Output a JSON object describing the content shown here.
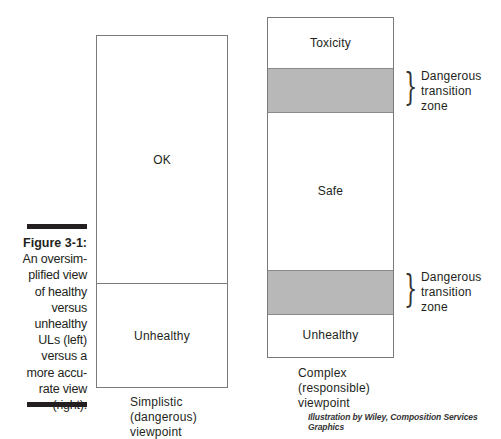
{
  "figure": {
    "number": "Figure 3-1:",
    "caption_lines": [
      "An oversim-",
      "plified view",
      "of healthy",
      "versus",
      "unhealthy",
      "ULs (left)",
      "versus a",
      "more accu-",
      "rate view",
      "(right)."
    ]
  },
  "left_diagram": {
    "zones": [
      {
        "label": "OK",
        "shaded": false
      },
      {
        "label": "Unhealthy",
        "shaded": false
      }
    ],
    "title_lines": [
      "Simplistic",
      "(dangerous)",
      "viewpoint"
    ]
  },
  "right_diagram": {
    "zones": [
      {
        "label": "Toxicity",
        "shaded": false
      },
      {
        "label": "",
        "shaded": true
      },
      {
        "label": "Safe",
        "shaded": false
      },
      {
        "label": "",
        "shaded": true
      },
      {
        "label": "Unhealthy",
        "shaded": false
      }
    ],
    "annotations": [
      {
        "lines": [
          "Dangerous",
          "transition",
          "zone"
        ]
      },
      {
        "lines": [
          "Dangerous",
          "transition",
          "zone"
        ]
      }
    ],
    "title_lines": [
      "Complex",
      "(responsible)",
      "viewpoint"
    ]
  },
  "credit": "Illustration by Wiley, Composition Services Graphics",
  "colors": {
    "shaded_zone": "#b8b8b8",
    "border": "#7a7a7a",
    "text": "#231f20"
  }
}
